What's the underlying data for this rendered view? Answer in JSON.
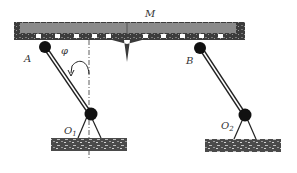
{
  "diagram": {
    "labels": {
      "beam": "M",
      "pivot_a": "A",
      "pivot_b": "B",
      "angle": "φ",
      "ground_pivot_1": "O",
      "ground_pivot_1_sub": "1",
      "ground_pivot_2": "O",
      "ground_pivot_2_sub": "2"
    },
    "colors": {
      "beam_fill": "#8a8a8a",
      "beam_dark": "#3a3a3a",
      "joint": "#111111",
      "link": "#222222",
      "ground": "#5a5a5a"
    }
  }
}
